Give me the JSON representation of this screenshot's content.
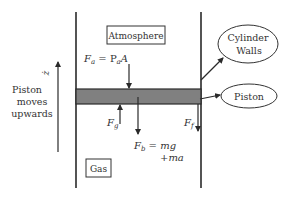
{
  "diagram": {
    "colors": {
      "line": "#2a2a2a",
      "piston_fill": "#808080",
      "text": "#333333",
      "background": "#ffffff"
    },
    "labels": {
      "atmosphere": "Atmosphere",
      "gas": "Gas",
      "cylinder_walls_line1": "Cylinder",
      "cylinder_walls_line2": "Walls",
      "piston": "Piston",
      "direction_line1": "Piston",
      "direction_line2": "moves",
      "direction_line3": "upwards",
      "z_dot": "ż"
    },
    "forces": {
      "fa": {
        "symbol": "F",
        "sub": "a",
        "equation": " = P",
        "eq_sub": "a",
        "eq_tail": "A"
      },
      "fg": {
        "symbol": "F",
        "sub": "g"
      },
      "fb": {
        "symbol": "F",
        "sub": "b",
        "equation": " = mg",
        "line2": "+ma"
      },
      "ff": {
        "symbol": "F",
        "sub": "f"
      }
    }
  }
}
